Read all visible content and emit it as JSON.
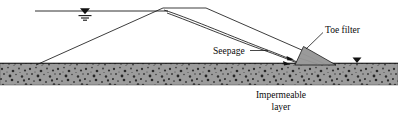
{
  "figure": {
    "kind": "engineering-cross-section",
    "background_color": "#ffffff",
    "line_color": "#1a1a1a",
    "width": 398,
    "height": 119
  },
  "labels": {
    "seepage": "Seepage",
    "toe_filter": "Toe filter",
    "impermeable_line1": "Impermeable",
    "impermeable_line2": "layer"
  },
  "elements": {
    "reservoir_water_surface": {
      "name": "reservoir water surface line",
      "y": 11,
      "x_start": 35,
      "x_end": 168
    },
    "upstream_water_level_symbol": {
      "name": "water table triangle symbol (upstream)",
      "x": 85,
      "y": 11,
      "color": "#111111"
    },
    "downstream_water_level_symbol": {
      "name": "water table triangle symbol (downstream tailwater)",
      "x": 357,
      "y": 62,
      "color": "#111111"
    },
    "dam_crest": {
      "name": "dam crest",
      "x_left": 163,
      "x_right": 206,
      "y": 8
    },
    "upstream_slope": {
      "name": "upstream face of dam",
      "from": [
        36,
        65
      ],
      "to": [
        163,
        8
      ]
    },
    "downstream_slope": {
      "name": "downstream face of dam",
      "from": [
        206,
        8
      ],
      "to": [
        336,
        65
      ]
    },
    "phreatic_lines": {
      "name": "seepage / phreatic flow lines",
      "count": 2
    },
    "toe_filter": {
      "name": "toe filter wedge",
      "fill_color": "#9a9a9a",
      "stroke_color": "#1a1a1a",
      "apex": [
        303,
        47
      ],
      "base_left": [
        295,
        65
      ],
      "base_right": [
        335,
        65
      ]
    },
    "impermeable_layer": {
      "name": "impermeable speckled soil layer",
      "x": 0,
      "y": 63,
      "width": 398,
      "height": 22,
      "base_color": "#9c9c9c",
      "speckle_color": "#333333"
    },
    "seepage_arrows": {
      "name": "seepage direction arrows",
      "count": 2
    },
    "leader_lines": {
      "seepage_leader": "from Seepage label to flow lines",
      "toe_filter_leader": "from Toe filter label to filter wedge"
    }
  }
}
